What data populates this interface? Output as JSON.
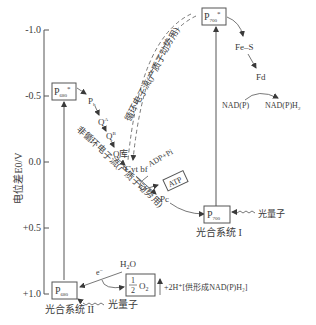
{
  "diagram": {
    "title": "",
    "y_axis": {
      "label": "电位差E0/V",
      "ticks": [
        "-1.0",
        "-0.5",
        "0.0",
        "+0.5",
        "+1.0"
      ]
    },
    "boxes": {
      "p680_star": {
        "main": "P",
        "sub": "680",
        "sup": "*"
      },
      "p700_star": {
        "main": "P",
        "sub": "700",
        "sup": "*"
      },
      "p680": {
        "main": "P",
        "sub": "680"
      },
      "p700": {
        "main": "P",
        "sub": "700"
      },
      "atp": "ATP",
      "half_o2_num": "1",
      "half_o2_den": "2",
      "half_o2_tail": "O",
      "half_o2_sub": "2"
    },
    "carriers": {
      "pheo": "P",
      "pheo_sub": "h",
      "qa": "Q",
      "qa_sup": "A",
      "qb": "Q",
      "qb_sup": "B",
      "qpool": "Q库",
      "cytbf": "Cyt bf",
      "pc": "Pc",
      "fes": "Fe–S",
      "fd": "Fd",
      "nadp": "NAD(P)",
      "nadph": "NAD(P)H",
      "nadph_sub": "2",
      "adp_pi": "ADP+Pi",
      "h2o": "H",
      "h2o_sub": "2",
      "h2o_tail": "O",
      "electron": "e",
      "electron_sup": "−"
    },
    "labels": {
      "cyclic_flow": "循环电子流(产质子动势用)",
      "noncyclic_flow": "非循环电子流(产质子动势用)",
      "photon_ps1": "光量子",
      "photon_ps2": "光量子",
      "ps1": "光合系统 I",
      "ps2": "光合系统 II",
      "protons": "+2H⁺[供形成NAD(P)H₂]"
    },
    "colors": {
      "ink": "#3a3a3a",
      "background": "#ffffff"
    }
  }
}
